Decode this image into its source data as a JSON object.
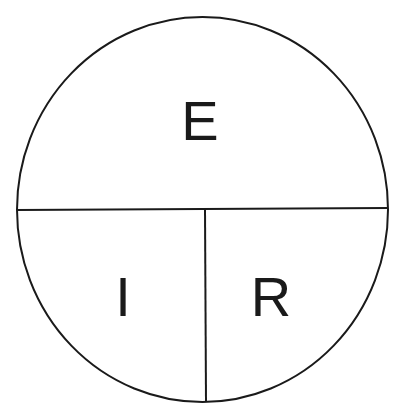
{
  "diagram": {
    "colors": {
      "stroke": "#1a1a1a",
      "background": "#ffffff"
    },
    "labels": {
      "top": "E",
      "bottom_left": "I",
      "bottom_right": "R"
    }
  }
}
